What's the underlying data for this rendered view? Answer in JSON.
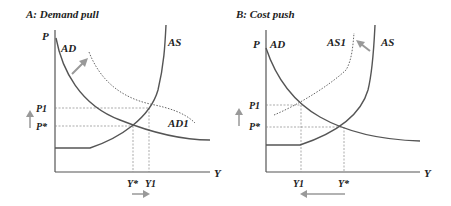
{
  "panels": [
    {
      "title": "A: Demand pull",
      "y_axis_label": "P",
      "x_axis_label": "Y",
      "curves": {
        "ad": "AD",
        "ad1": "AD1",
        "as": "AS"
      },
      "price_ticks": [
        "P1",
        "P*"
      ],
      "output_ticks": [
        "Y*",
        "Y1"
      ],
      "shift_description": "AD shifts right to AD1; price rises from P* to P1; output rises from Y* to Y1"
    },
    {
      "title": "B: Cost push",
      "y_axis_label": "P",
      "x_axis_label": "Y",
      "curves": {
        "ad": "AD",
        "as1": "AS1",
        "as": "AS"
      },
      "price_ticks": [
        "P1",
        "P*"
      ],
      "output_ticks": [
        "Y1",
        "Y*"
      ],
      "shift_description": "AS shifts left to AS1; price rises from P* to P1; output falls from Y* to Y1"
    }
  ],
  "colors": {
    "curve": "#555555",
    "dotted": "#666666",
    "arrow": "#999999",
    "text": "#222222"
  }
}
